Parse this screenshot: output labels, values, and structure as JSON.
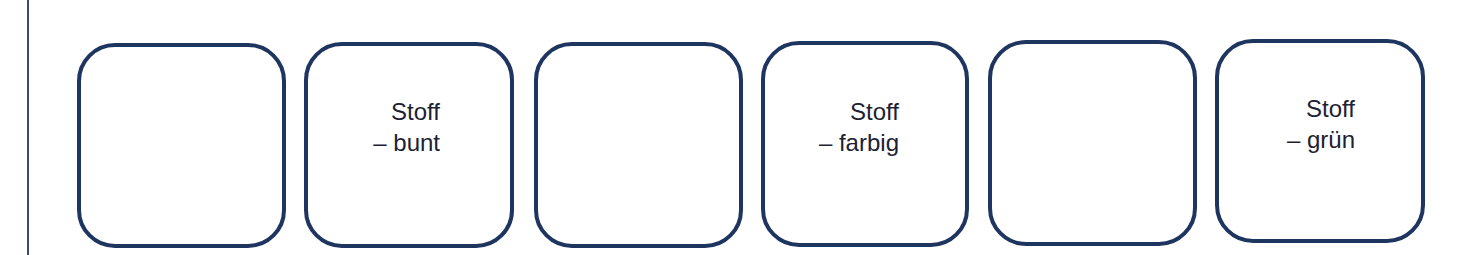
{
  "colors": {
    "card_border": "#1e3560",
    "text": "#1c2233",
    "rule": "#3a4a72",
    "background": "#ffffff"
  },
  "cards": [
    {
      "index": 1,
      "line1": "",
      "line2": ""
    },
    {
      "index": 2,
      "line1": "Stoff",
      "line2": "– bunt"
    },
    {
      "index": 3,
      "line1": "",
      "line2": ""
    },
    {
      "index": 4,
      "line1": "Stoff",
      "line2": "– farbig"
    },
    {
      "index": 5,
      "line1": "",
      "line2": ""
    },
    {
      "index": 6,
      "line1": "Stoff",
      "line2": "– grün"
    }
  ]
}
